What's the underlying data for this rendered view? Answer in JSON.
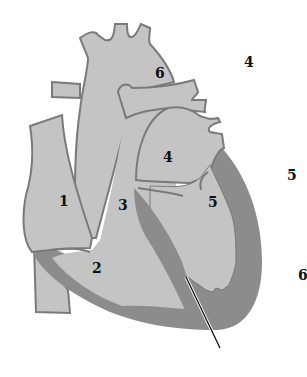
{
  "diagram": {
    "type": "anatomical-heart-cross-section",
    "colors": {
      "background": "#ffffff",
      "chamber_fill": "#c4c4c4",
      "wall_fill": "#8c8c8c",
      "outline": "#7a7a7a",
      "label": "#111111",
      "pointer": "#111111"
    },
    "labels": {
      "inner": [
        {
          "id": "label-1",
          "text": "1",
          "x": 59,
          "y": 206
        },
        {
          "id": "label-2",
          "text": "2",
          "x": 92,
          "y": 273
        },
        {
          "id": "label-3",
          "text": "3",
          "x": 118,
          "y": 210
        },
        {
          "id": "label-4",
          "text": "4",
          "x": 163,
          "y": 162
        },
        {
          "id": "label-5",
          "text": "5",
          "x": 208,
          "y": 207
        },
        {
          "id": "label-6",
          "text": "6",
          "x": 155,
          "y": 78
        }
      ],
      "outer": [
        {
          "id": "outer-label-4",
          "text": "4",
          "x": 244,
          "y": 67
        },
        {
          "id": "outer-label-5",
          "text": "5",
          "x": 287,
          "y": 180
        },
        {
          "id": "outer-label-6",
          "text": "6",
          "x": 298,
          "y": 280
        }
      ]
    }
  }
}
